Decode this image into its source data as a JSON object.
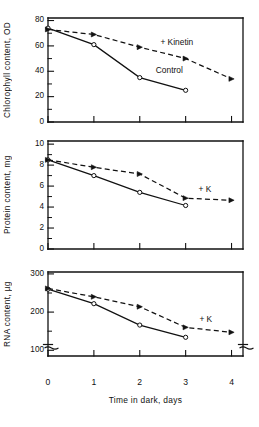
{
  "figure": {
    "xlabel": "Time in dark, days",
    "xticks": [
      "0",
      "1",
      "2",
      "3",
      "4"
    ],
    "xlim": [
      0,
      4.25
    ]
  },
  "chart_data": [
    {
      "type": "line",
      "panel": "top",
      "title": "",
      "xlabel": "",
      "ylabel": "Chlorophyll content, OD",
      "x": [
        0,
        1,
        2,
        3,
        4
      ],
      "ylim": [
        0,
        82
      ],
      "yticks": [
        0,
        20,
        40,
        60,
        80
      ],
      "ytick_labels": [
        "0",
        "20",
        "40",
        "60",
        "80"
      ],
      "yminor": [
        10,
        30,
        50,
        70
      ],
      "grid": false,
      "axis_break_y": false,
      "series": [
        {
          "name": "Control",
          "style": "solid",
          "marker": "open-circle",
          "x": [
            0,
            1,
            2,
            3
          ],
          "values": [
            74,
            61,
            35,
            25
          ],
          "label": "Control",
          "label_x": 2.35,
          "label_y": 40
        },
        {
          "name": "+ Kinetin",
          "style": "dashed",
          "marker": "filled-triangle",
          "x": [
            0,
            1,
            2,
            3,
            4
          ],
          "values": [
            73,
            69,
            59,
            50,
            34
          ],
          "label": "+ Kinetin",
          "label_x": 2.45,
          "label_y": 62
        }
      ]
    },
    {
      "type": "line",
      "panel": "middle",
      "title": "",
      "xlabel": "",
      "ylabel": "Protein content, mg",
      "x": [
        0,
        1,
        2,
        3,
        4
      ],
      "ylim": [
        0,
        10.3
      ],
      "yticks": [
        0,
        2,
        4,
        6,
        8,
        10
      ],
      "ytick_labels": [
        "0",
        "2",
        "4",
        "6",
        "8",
        "10"
      ],
      "yminor": [
        1,
        3,
        5,
        7,
        9
      ],
      "grid": false,
      "axis_break_y": false,
      "series": [
        {
          "name": "Control",
          "style": "solid",
          "marker": "open-circle",
          "x": [
            0,
            1,
            2,
            3
          ],
          "values": [
            8.5,
            7.0,
            5.4,
            4.15
          ],
          "label": "",
          "label_x": null,
          "label_y": null
        },
        {
          "name": "+ K",
          "style": "dashed",
          "marker": "filled-triangle",
          "x": [
            0,
            1,
            2,
            3,
            4
          ],
          "values": [
            8.5,
            7.8,
            7.15,
            4.85,
            4.65
          ],
          "label": "+ K",
          "label_x": 3.28,
          "label_y": 5.6
        }
      ]
    },
    {
      "type": "line",
      "panel": "bottom",
      "title": "",
      "xlabel": "Time in dark, days",
      "ylabel": "RNA content, µg",
      "x": [
        0,
        1,
        2,
        3,
        4
      ],
      "ylim": [
        85,
        305
      ],
      "yticks": [
        100,
        200,
        300
      ],
      "ytick_labels": [
        "100",
        "200",
        "300"
      ],
      "yminor": [
        150,
        250
      ],
      "grid": false,
      "axis_break_y": true,
      "series": [
        {
          "name": "Control",
          "style": "solid",
          "marker": "open-circle",
          "x": [
            0,
            1,
            2,
            3
          ],
          "values": [
            260,
            222,
            166,
            134
          ],
          "label": "",
          "label_x": null,
          "label_y": null
        },
        {
          "name": "+ K",
          "style": "dashed",
          "marker": "filled-triangle",
          "x": [
            0,
            1,
            2,
            3,
            4
          ],
          "values": [
            262,
            240,
            214,
            160,
            147
          ],
          "label": "+ K",
          "label_x": 3.3,
          "label_y": 178
        }
      ]
    }
  ],
  "colors": {
    "ink": "#111111",
    "background": "#ffffff"
  }
}
